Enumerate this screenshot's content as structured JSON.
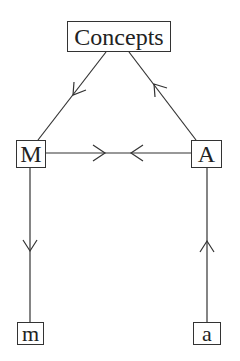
{
  "diagram": {
    "nodes": {
      "concepts": {
        "label": "Concepts"
      },
      "M": {
        "label": "M"
      },
      "A": {
        "label": "A"
      },
      "m": {
        "label": "m"
      },
      "a": {
        "label": "a"
      }
    },
    "edges": [
      {
        "from": "Concepts",
        "to": "M",
        "direction": "Concepts → M"
      },
      {
        "from": "A",
        "to": "Concepts",
        "direction": "A → Concepts"
      },
      {
        "from": "M",
        "to": "A",
        "direction": "M → (middle)"
      },
      {
        "from": "A",
        "to": "M",
        "direction": "A → (middle)"
      },
      {
        "from": "M",
        "to": "m",
        "direction": "M → m"
      },
      {
        "from": "a",
        "to": "A",
        "direction": "a → A"
      }
    ],
    "colors": {
      "stroke": "#333333",
      "background": "#ffffff"
    }
  }
}
